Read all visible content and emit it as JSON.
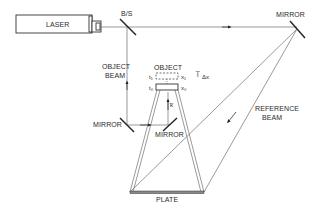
{
  "diagram": {
    "type": "optical-holography-setup",
    "components": {
      "laser": {
        "label": "LASER"
      },
      "beam_splitter": {
        "label": "B/S"
      },
      "mirror_top_right": {
        "label": "MIRROR"
      },
      "mirror_left": {
        "label": "MIRROR"
      },
      "mirror_center": {
        "label": "MIRROR"
      },
      "object": {
        "label": "OBJECT",
        "state_1": {
          "time": "t₁",
          "position": "x₁"
        },
        "state_0": {
          "time": "t₀",
          "position": "x₀"
        },
        "displacement_vector": "i̅",
        "displacement_subscript": "Δx",
        "wave_vector": "k̅"
      },
      "plate": {
        "label": "PLATE"
      }
    },
    "beams": {
      "object_beam": {
        "label_line1": "OBJECT",
        "label_line2": "BEAM"
      },
      "reference_beam": {
        "label_line1": "REFERENCE",
        "label_line2": "BEAM"
      }
    },
    "colors": {
      "line": "#333333",
      "background": "#ffffff"
    }
  }
}
